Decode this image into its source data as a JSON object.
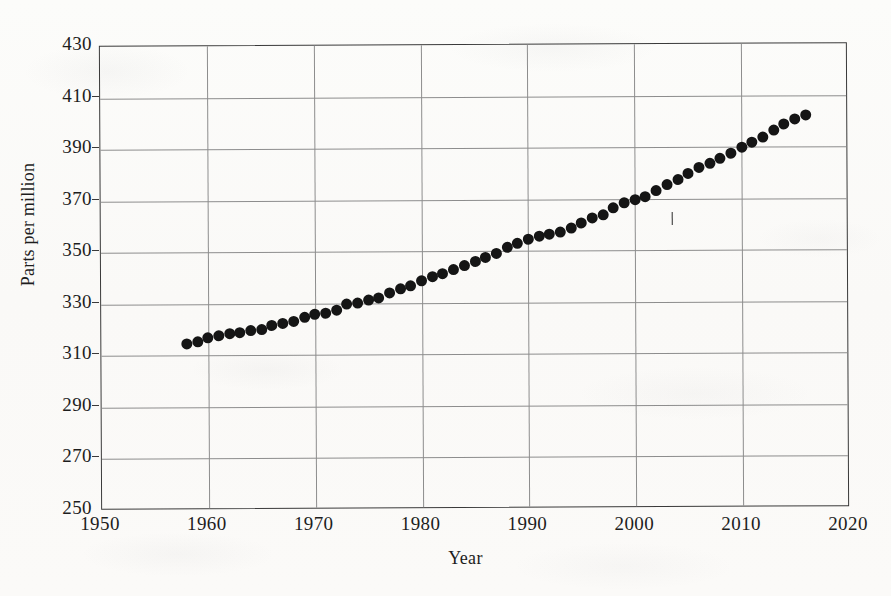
{
  "chart_data": {
    "type": "scatter",
    "title": "",
    "xlabel": "Year",
    "ylabel": "Parts per million",
    "xlim": [
      1950,
      2020
    ],
    "ylim": [
      250,
      430
    ],
    "xticks": [
      1950,
      1960,
      1970,
      1980,
      1990,
      2000,
      2010,
      2020
    ],
    "yticks": [
      250,
      270,
      290,
      310,
      330,
      350,
      370,
      390,
      410,
      430
    ],
    "grid": true,
    "legend": null,
    "marker": "filled-circle",
    "marker_color": "#151515",
    "series": [
      {
        "name": "Atmospheric CO2 concentration",
        "x": [
          1958,
          1959,
          1960,
          1961,
          1962,
          1963,
          1964,
          1965,
          1966,
          1967,
          1968,
          1969,
          1970,
          1971,
          1972,
          1973,
          1974,
          1975,
          1976,
          1977,
          1978,
          1979,
          1980,
          1981,
          1982,
          1983,
          1984,
          1985,
          1986,
          1987,
          1988,
          1989,
          1990,
          1991,
          1992,
          1993,
          1994,
          1995,
          1996,
          1997,
          1998,
          1999,
          2000,
          2001,
          2002,
          2003,
          2004,
          2005,
          2006,
          2007,
          2008,
          2009,
          2010,
          2011,
          2012,
          2013,
          2014,
          2015,
          2016
        ],
        "values": [
          314.7,
          315.4,
          316.9,
          317.6,
          318.4,
          319.0,
          319.6,
          320.0,
          321.4,
          322.2,
          323.0,
          324.6,
          325.7,
          326.3,
          327.5,
          329.7,
          330.2,
          331.1,
          332.0,
          333.8,
          335.4,
          336.8,
          338.8,
          340.1,
          341.4,
          343.0,
          344.6,
          346.0,
          347.4,
          349.2,
          351.6,
          353.1,
          354.4,
          355.6,
          356.4,
          357.1,
          358.8,
          360.8,
          362.6,
          363.7,
          366.7,
          368.4,
          369.5,
          371.0,
          373.1,
          375.6,
          377.4,
          379.7,
          381.9,
          383.7,
          385.6,
          387.4,
          389.9,
          391.6,
          393.8,
          396.5,
          398.6,
          400.8,
          402.3
        ]
      }
    ],
    "annotations": [
      {
        "name": "tick-mark-artifact",
        "x": 2003.4,
        "y": 365.5,
        "text": ""
      }
    ]
  },
  "axes": {
    "y_tick_labels": [
      "430",
      "410",
      "390",
      "370",
      "350",
      "330",
      "310",
      "290",
      "270",
      "250"
    ],
    "x_tick_labels": [
      "1950",
      "1960",
      "1970",
      "1980",
      "1990",
      "2000",
      "2010",
      "2020"
    ],
    "y_axis_title": "Parts per million",
    "x_axis_title": "Year"
  },
  "colors": {
    "marker": "#151515",
    "gridline": "#8d8d8d",
    "frame": "#3a3a3a",
    "text": "#1d1d1d",
    "paper": "#fbfbf9"
  }
}
